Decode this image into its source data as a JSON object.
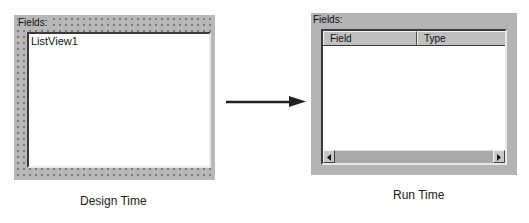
{
  "design_time": {
    "group_label": "Fields:",
    "listview_name": "ListView1",
    "caption": "Design Time"
  },
  "run_time": {
    "group_label": "Fields:",
    "columns": [
      {
        "label": "Field"
      },
      {
        "label": "Type"
      }
    ],
    "rows": [],
    "scrollbar": {
      "left_icon": "scroll-left-arrow-icon",
      "right_icon": "scroll-right-arrow-icon"
    },
    "caption": "Run Time"
  },
  "connector": {
    "icon": "right-arrow-icon"
  },
  "colors": {
    "panel_bg": "#b4b4b4",
    "listview_bg": "#ffffff",
    "header_bg": "#c0c0c0",
    "arrow": "#222222"
  }
}
